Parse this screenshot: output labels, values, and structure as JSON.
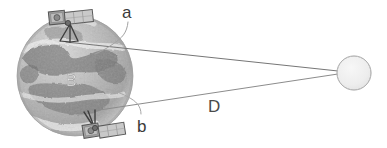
{
  "figure": {
    "kind": "schematic-diagram",
    "width": 387,
    "height": 148,
    "background_color": "#ffffff"
  },
  "labels": {
    "upper_path": "a",
    "lower_path": "b",
    "distance": "D",
    "earth": "B"
  },
  "objects": {
    "earth": {
      "name": "textured gray globe",
      "center_x": 75,
      "center_y": 76,
      "radius_x": 58,
      "radius_y": 60,
      "fill": "#b9b9b9",
      "outline": "#8f8f8f"
    },
    "far_body": {
      "name": "distant circular body",
      "center_x": 354,
      "center_y": 73,
      "radius": 17,
      "fill": "#ececec",
      "outline": "#8a8a8a"
    },
    "satellite_top": {
      "name": "satellite with solar panel",
      "x": 48,
      "y": 10,
      "body_fill": "#9a9a9a",
      "panel_fill": "#c6c6c6",
      "outline": "#5d5d5d"
    },
    "satellite_bottom": {
      "name": "satellite with solar panel",
      "x": 84,
      "y": 118,
      "body_fill": "#9a9a9a",
      "panel_fill": "#c6c6c6",
      "outline": "#5d5d5d"
    }
  },
  "lines": {
    "line_a": {
      "label": "a",
      "from": "satellite_top",
      "to": "far_body",
      "x1": 66,
      "y1": 42,
      "x2": 338,
      "y2": 71,
      "stroke": "#7a7a7a",
      "stroke_width": 1
    },
    "line_b": {
      "label": "b",
      "from": "satellite_bottom",
      "to": "far_body",
      "x1": 92,
      "y1": 110,
      "x2": 338,
      "y2": 74,
      "stroke": "#8a8a8a",
      "stroke_width": 1
    },
    "leader_a": {
      "label": "a",
      "stroke": "#9b9b9b",
      "stroke_width": 1
    },
    "leader_b": {
      "label": "b",
      "stroke": "#9b9b9b",
      "stroke_width": 1
    }
  },
  "colors": {
    "stroke_primary": "#7a7a7a",
    "stroke_light": "#9b9b9b",
    "text": "#3a3a3a",
    "earth_label_text": "#e4e4e4",
    "far_body_fill": "#ececec"
  }
}
